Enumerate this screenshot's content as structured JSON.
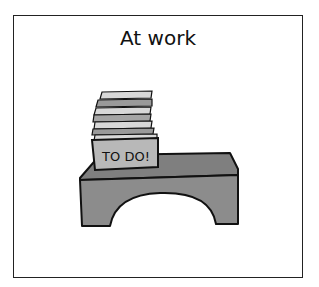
{
  "card": {
    "title": "At work",
    "illustration": {
      "label": "TO DO!",
      "description": "stack of papers in a TO DO! tray on a gray desk"
    }
  },
  "colors": {
    "desk": "#8a8a8a",
    "tray": "#b8b8b8",
    "paper": "#d8d8d8",
    "outline": "#111111"
  }
}
